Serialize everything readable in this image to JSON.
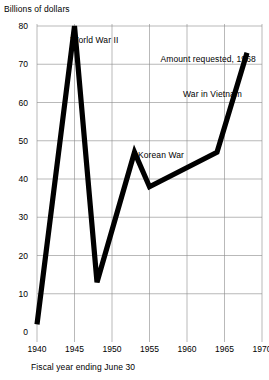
{
  "chart_data": {
    "type": "line",
    "title": "",
    "ylabel": "Billions of dollars",
    "xlabel": "Fiscal year ending June 30",
    "xlim": [
      1938.5,
      1970.5
    ],
    "ylim": [
      0,
      80
    ],
    "grid": true,
    "legend": "none",
    "ytick_labels": [
      "0",
      "10",
      "20",
      "30",
      "40",
      "50",
      "60",
      "70",
      "80"
    ],
    "ytick_values": [
      0,
      10,
      20,
      30,
      40,
      50,
      60,
      70,
      80
    ],
    "xtick_labels": [
      "1940",
      "1945",
      "1950",
      "1955",
      "1960",
      "1965",
      "1970"
    ],
    "xtick_values": [
      1940,
      1945,
      1950,
      1955,
      1960,
      1965,
      1970
    ],
    "series": [
      {
        "name": "Defense spending",
        "color": "#000000",
        "x": [
          1940,
          1945,
          1948,
          1953,
          1955,
          1964,
          1968
        ],
        "values": [
          2,
          80,
          13,
          47,
          38,
          47,
          73
        ]
      }
    ],
    "annotations": [
      {
        "text": "World War II",
        "x": 1945,
        "y": 76
      },
      {
        "text": "Amount requested, 1968",
        "x": 1957,
        "y": 71
      },
      {
        "text": "War in Vietnam",
        "x": 1960,
        "y": 62
      },
      {
        "text": "Korean War",
        "x": 1954,
        "y": 46
      }
    ]
  }
}
